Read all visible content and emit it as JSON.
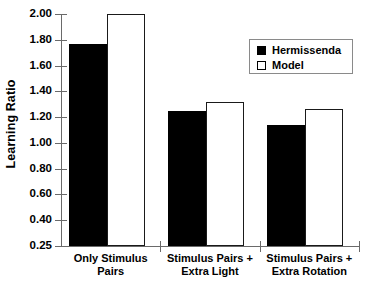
{
  "chart_data": {
    "type": "bar",
    "title": "",
    "xlabel": "",
    "ylabel": "Learning Ratio",
    "ylim": [
      0.25,
      2.0
    ],
    "grid": false,
    "legend_position": "top-right",
    "categories": [
      "Only Stimulus Pairs",
      "Stimulus Pairs + Extra Light",
      "Stimulus Pairs + Extra Rotation"
    ],
    "category_lines": [
      [
        "Only Stimulus Pairs"
      ],
      [
        "Stimulus Pairs +",
        "Extra Light"
      ],
      [
        "Stimulus Pairs +",
        "Extra Rotation"
      ]
    ],
    "series": [
      {
        "name": "Hermissenda",
        "style": "filled",
        "color": "#000000",
        "values": [
          1.77,
          1.25,
          1.14
        ]
      },
      {
        "name": "Model",
        "style": "open",
        "color": "#ffffff",
        "values": [
          2.0,
          1.32,
          1.26
        ]
      }
    ],
    "ytick_labels": [
      "2.00",
      "1.80",
      "1.60",
      "1.40",
      "1.20",
      "1.00",
      "0.80",
      "0.60",
      "0.40",
      "0.25"
    ],
    "ytick_values": [
      2.0,
      1.8,
      1.6,
      1.4,
      1.2,
      1.0,
      0.8,
      0.6,
      0.4,
      0.25
    ]
  },
  "legend": {
    "entries": [
      {
        "label": "Hermissenda"
      },
      {
        "label": "Model"
      }
    ]
  },
  "axis": {
    "y_title": "Learning Ratio"
  }
}
